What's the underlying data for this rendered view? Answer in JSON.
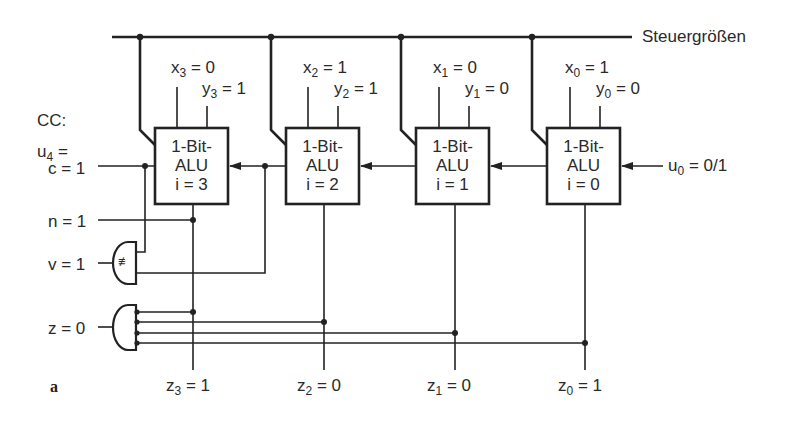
{
  "diagram": {
    "bus_label": "Steuergrößen",
    "figure_label": "a",
    "cc_label": "CC:",
    "alus": [
      {
        "line1": "1-Bit-",
        "line2": "ALU",
        "line3": "i = 3",
        "x_var": "x",
        "x_sub": "3",
        "x_val": " = 0",
        "y_var": "y",
        "y_sub": "3",
        "y_val": " = 1",
        "z_var": "z",
        "z_sub": "3",
        "z_val": " = 1"
      },
      {
        "line1": "1-Bit-",
        "line2": "ALU",
        "line3": "i = 2",
        "x_var": "x",
        "x_sub": "2",
        "x_val": " = 1",
        "y_var": "y",
        "y_sub": "2",
        "y_val": " = 1",
        "z_var": "z",
        "z_sub": "2",
        "z_val": " = 0"
      },
      {
        "line1": "1-Bit-",
        "line2": "ALU",
        "line3": "i = 1",
        "x_var": "x",
        "x_sub": "1",
        "x_val": " = 0",
        "y_var": "y",
        "y_sub": "1",
        "y_val": " = 0",
        "z_var": "z",
        "z_sub": "1",
        "z_val": " = 0"
      },
      {
        "line1": "1-Bit-",
        "line2": "ALU",
        "line3": "i = 0",
        "x_var": "x",
        "x_sub": "0",
        "x_val": " = 1",
        "y_var": "y",
        "y_sub": "0",
        "y_val": " = 0",
        "z_var": "z",
        "z_sub": "0",
        "z_val": " = 1"
      }
    ],
    "flags": {
      "u4_var": "u",
      "u4_sub": "4",
      "u4_eq": " =",
      "c": "c = 1",
      "n": "n = 1",
      "v": "v = 1",
      "z": "z = 0"
    },
    "carry_in": {
      "var": "u",
      "sub": "0",
      "val": " = 0/1"
    },
    "xor_gate_symbol": "≢"
  }
}
